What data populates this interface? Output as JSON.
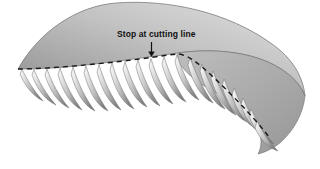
{
  "figure": {
    "type": "technical-illustration",
    "background_color": "#ffffff",
    "annotation": {
      "label": "Stop at cutting line",
      "arrow": "down-arrow-icon",
      "points_to": "cutting-line"
    },
    "cutting_line": {
      "name": "cutting-line",
      "style": "dashed",
      "color": "#1a1a1a",
      "dash_pattern": "5 4"
    },
    "body": {
      "name": "panel-body",
      "fill_light": "#d8d8d8",
      "fill_mid": "#b6b6b6",
      "fill_dark": "#8f8f8f",
      "outline_color": "#6e6e6e"
    },
    "teeth": {
      "name": "fringe-teeth",
      "count": 21,
      "fill_light": "#f2f2f2",
      "fill_dark": "#7e7e7e"
    }
  }
}
